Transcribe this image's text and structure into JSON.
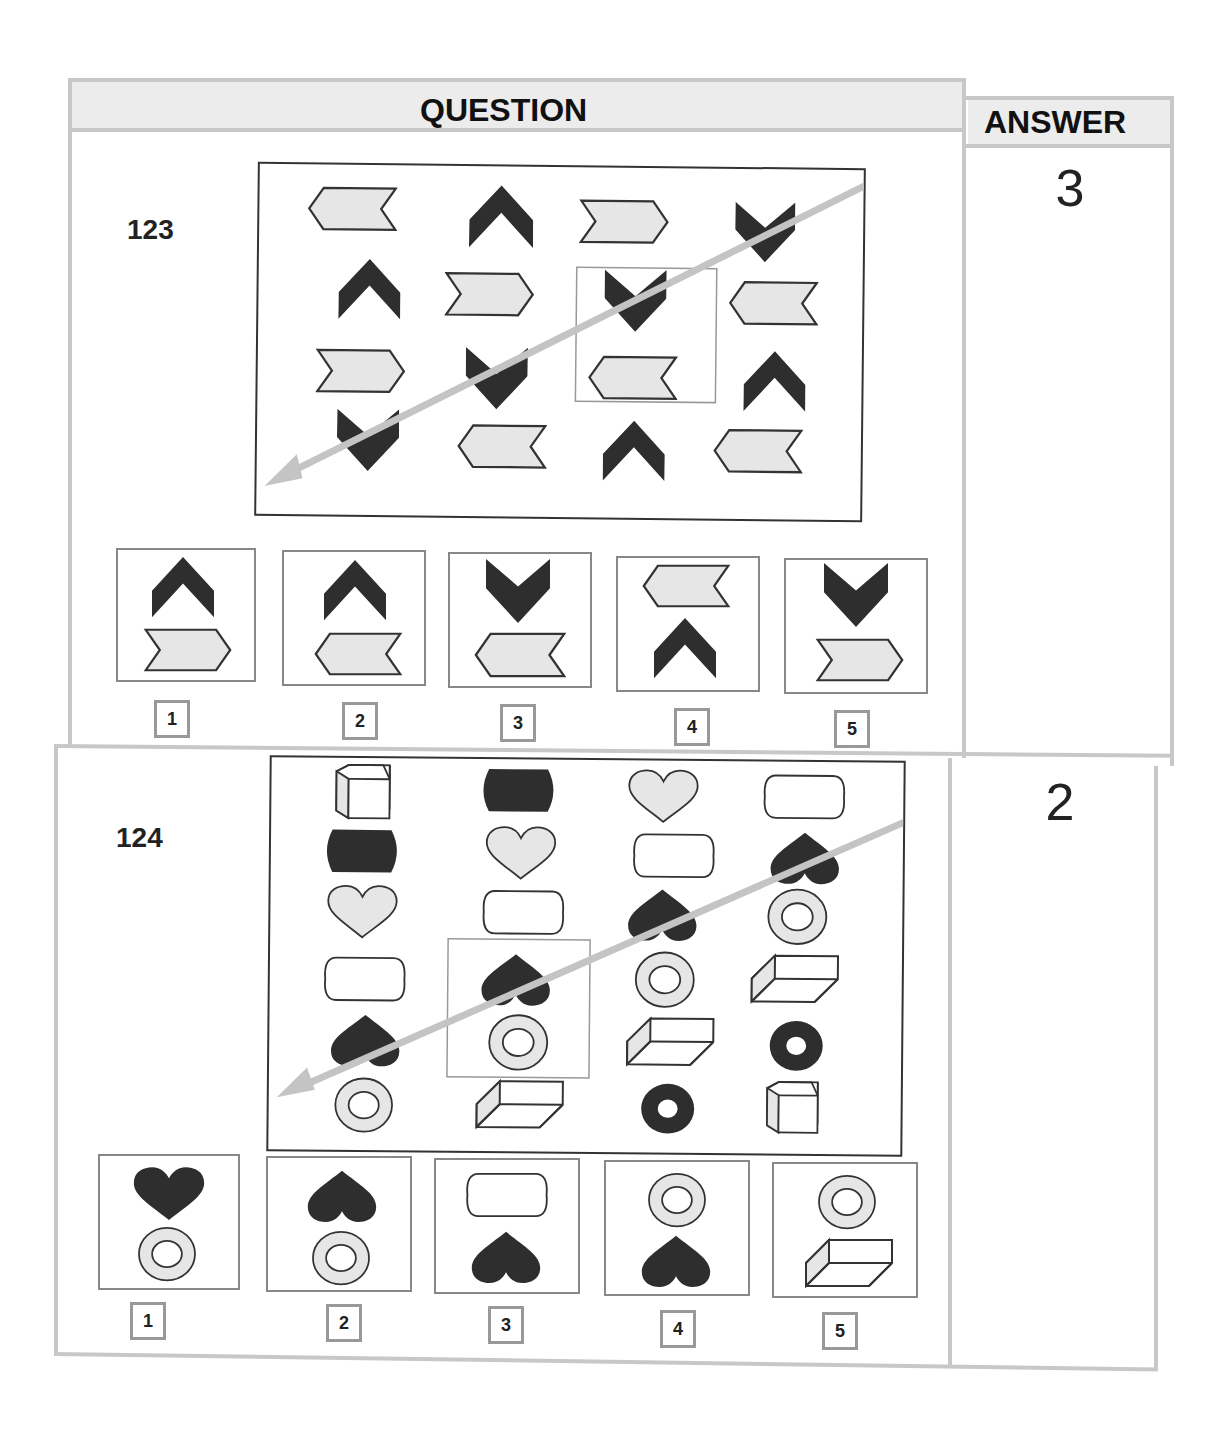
{
  "header": {
    "question_label": "QUESTION",
    "answer_label": "ANSWER"
  },
  "questions": [
    {
      "number": "123",
      "answer": "3",
      "grid_rows": 4,
      "grid_cols": 4,
      "grid": [
        [
          "light-chevron-left",
          "dark-chevron-up",
          "light-chevron-right",
          "dark-chevron-down"
        ],
        [
          "dark-chevron-up",
          "light-chevron-right",
          "dark-chevron-down",
          "light-chevron-left"
        ],
        [
          "light-chevron-right",
          "dark-chevron-down",
          "light-chevron-left",
          "dark-chevron-up"
        ],
        [
          "dark-chevron-down",
          "light-chevron-left",
          "dark-chevron-up",
          "light-chevron-left"
        ]
      ],
      "highlight": "rows 2-3, column 3",
      "arrow": "diagonal, top-right to bottom-left",
      "options": [
        {
          "label": "1",
          "top": "dark-chevron-up",
          "bottom": "light-chevron-right"
        },
        {
          "label": "2",
          "top": "dark-chevron-up",
          "bottom": "light-chevron-left"
        },
        {
          "label": "3",
          "top": "dark-chevron-down",
          "bottom": "light-chevron-left"
        },
        {
          "label": "4",
          "top": "light-chevron-left",
          "bottom": "dark-chevron-up"
        },
        {
          "label": "5",
          "top": "dark-chevron-down",
          "bottom": "light-chevron-right"
        }
      ]
    },
    {
      "number": "124",
      "answer": "2",
      "grid_rows": 6,
      "grid_cols": 4,
      "grid": [
        [
          "cube",
          "dark-barrel",
          "light-heart",
          "white-rounded-rect"
        ],
        [
          "dark-barrel",
          "light-heart",
          "white-rounded-rect",
          "dark-heart-inverted"
        ],
        [
          "light-heart",
          "white-rounded-rect",
          "dark-heart-inverted",
          "light-ring"
        ],
        [
          "white-rounded-rect",
          "dark-heart-inverted",
          "light-ring",
          "flat-box"
        ],
        [
          "dark-heart-inverted",
          "light-ring",
          "flat-box",
          "dark-ring"
        ],
        [
          "light-ring",
          "flat-box",
          "dark-ring",
          "cube"
        ]
      ],
      "highlight": "rows 4-5, column 2",
      "arrow": "diagonal, top-right to bottom-left",
      "options": [
        {
          "label": "1",
          "top": "dark-heart",
          "bottom": "light-ring"
        },
        {
          "label": "2",
          "top": "dark-heart-inverted",
          "bottom": "light-ring"
        },
        {
          "label": "3",
          "top": "white-rounded-rect",
          "bottom": "dark-heart-inverted"
        },
        {
          "label": "4",
          "top": "light-ring",
          "bottom": "dark-heart-inverted"
        },
        {
          "label": "5",
          "top": "light-ring",
          "bottom": "flat-box"
        }
      ]
    }
  ],
  "colors": {
    "dark": "#2e2e2e",
    "light": "#e6e6e6",
    "border": "#c8c8c8",
    "arrow": "#c4c4c4"
  }
}
